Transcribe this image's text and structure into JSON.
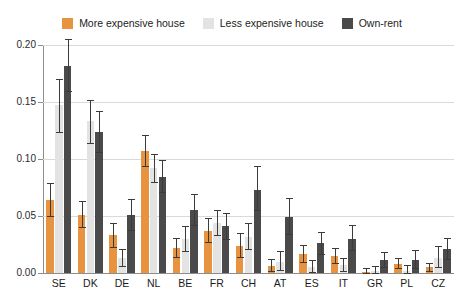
{
  "legend": {
    "position": "top-center",
    "items": [
      {
        "label": "More expensive house",
        "color": "#e8933f",
        "key": "more"
      },
      {
        "label": "Less expensive house",
        "color": "#e3e3e3",
        "key": "less"
      },
      {
        "label": "Own-rent",
        "color": "#4a4a4a",
        "key": "own"
      }
    ]
  },
  "axis": {
    "y_ticks": [
      "0.00",
      "0.05",
      "0.10",
      "0.15",
      "0.20"
    ],
    "y_tick_values": [
      0.0,
      0.05,
      0.1,
      0.15,
      0.2
    ],
    "grid": true
  },
  "chart_data": {
    "type": "bar",
    "title": "",
    "subtitle": "",
    "xlabel": "",
    "ylabel": "",
    "ylim": [
      0.0,
      0.2
    ],
    "grid": true,
    "legend_position": "top-center",
    "errorbars": true,
    "categories": [
      "SE",
      "DK",
      "DE",
      "NL",
      "BE",
      "FR",
      "CH",
      "AT",
      "ES",
      "IT",
      "GR",
      "PL",
      "CZ"
    ],
    "series": [
      {
        "name": "More expensive house",
        "color": "#e8933f",
        "values": [
          0.064,
          0.051,
          0.033,
          0.107,
          0.022,
          0.037,
          0.024,
          0.006,
          0.017,
          0.015,
          0.001,
          0.008,
          0.005
        ],
        "err_low": [
          0.05,
          0.04,
          0.023,
          0.094,
          0.014,
          0.027,
          0.014,
          0.002,
          0.01,
          0.009,
          0.0,
          0.004,
          0.002
        ],
        "err_high": [
          0.079,
          0.063,
          0.044,
          0.121,
          0.031,
          0.048,
          0.035,
          0.012,
          0.025,
          0.022,
          0.004,
          0.013,
          0.009
        ]
      },
      {
        "name": "Less expensive house",
        "color": "#e3e3e3",
        "values": [
          0.147,
          0.133,
          0.013,
          0.092,
          0.03,
          0.044,
          0.032,
          0.01,
          0.005,
          0.007,
          0.002,
          0.002,
          0.013
        ],
        "err_low": [
          0.124,
          0.114,
          0.006,
          0.08,
          0.019,
          0.033,
          0.021,
          0.003,
          0.001,
          0.002,
          0.0,
          0.0,
          0.005
        ],
        "err_high": [
          0.17,
          0.152,
          0.021,
          0.104,
          0.041,
          0.055,
          0.044,
          0.019,
          0.011,
          0.013,
          0.006,
          0.007,
          0.024
        ]
      },
      {
        "name": "Own-rent",
        "color": "#4a4a4a",
        "values": [
          0.182,
          0.124,
          0.051,
          0.084,
          0.055,
          0.041,
          0.073,
          0.049,
          0.026,
          0.03,
          0.011,
          0.011,
          0.021
        ],
        "err_low": [
          0.16,
          0.106,
          0.038,
          0.071,
          0.042,
          0.03,
          0.055,
          0.034,
          0.017,
          0.02,
          0.005,
          0.004,
          0.012
        ],
        "err_high": [
          0.205,
          0.142,
          0.065,
          0.099,
          0.069,
          0.053,
          0.094,
          0.066,
          0.036,
          0.042,
          0.018,
          0.02,
          0.031
        ]
      }
    ]
  }
}
